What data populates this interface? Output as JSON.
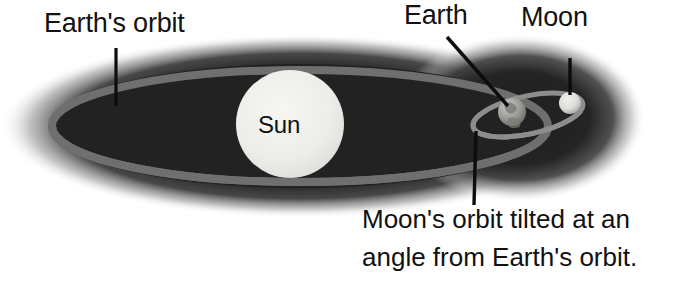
{
  "diagram": {
    "title_context": "Earth and Moon orbit diagram",
    "labels": {
      "earths_orbit": "Earth's orbit",
      "earth": "Earth",
      "moon": "Moon",
      "sun": "Sun"
    },
    "caption": {
      "line1": "Moon's orbit tilted at an",
      "line2": "angle from Earth's orbit."
    },
    "bodies": [
      {
        "name": "sun",
        "label": "Sun",
        "cx": 290,
        "cy": 124,
        "r": 54,
        "fill": "#ededea"
      },
      {
        "name": "earth",
        "label": "Earth",
        "cx": 512,
        "cy": 112,
        "r": 14,
        "fill": "#9a9a98"
      },
      {
        "name": "moon",
        "label": "Moon",
        "cx": 570,
        "cy": 103,
        "r": 11,
        "fill": "#e2e2de"
      }
    ],
    "orbits": [
      {
        "name": "earth-orbit-ellipse",
        "cx": 300,
        "cy": 126,
        "rx": 248,
        "ry": 56,
        "stroke": "#6f6f6f",
        "stroke_width": 8
      },
      {
        "name": "moon-orbit-ellipse",
        "cx": 528,
        "cy": 115,
        "rx": 56,
        "ry": 19,
        "rotation_deg": -12,
        "stroke": "#8a8a88",
        "stroke_width": 5
      }
    ],
    "leader_lines": [
      {
        "name": "earths-orbit-leader",
        "x1": 116,
        "y1": 48,
        "x2": 116,
        "y2": 106
      },
      {
        "name": "earth-leader",
        "x1": 447,
        "y1": 37,
        "x2": 508,
        "y2": 106
      },
      {
        "name": "moon-leader",
        "x1": 570,
        "y1": 58,
        "x2": 570,
        "y2": 95
      },
      {
        "name": "moon-orbit-leader",
        "x1": 476,
        "y1": 131,
        "x2": 474,
        "y2": 205
      }
    ],
    "colors": {
      "background": "#ffffff",
      "space_dark": "#242424",
      "orbit_gray": "#6f6f6f",
      "sun_light": "#ededea",
      "text_dark": "#111111"
    }
  }
}
